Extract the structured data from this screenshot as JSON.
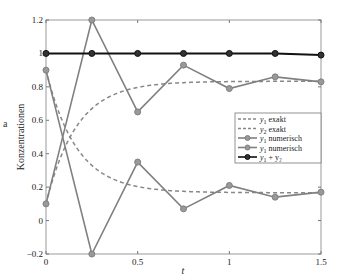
{
  "chart_data": {
    "type": "line",
    "title": "",
    "xlabel": "t",
    "ylabel": "Konzentrationen",
    "xlim": [
      0,
      1.5
    ],
    "ylim": [
      -0.2,
      1.2
    ],
    "grid": false,
    "legend_position": "right-center inside",
    "x_ticks": [
      0,
      0.5,
      1,
      1.5
    ],
    "x_tick_labels": [
      "0",
      "0.5",
      "1",
      "1.5"
    ],
    "y_ticks": [
      -0.2,
      0,
      0.2,
      0.4,
      0.6,
      0.8,
      1,
      1.2
    ],
    "y_tick_labels": [
      "−0.2",
      "0",
      "0.2",
      "0.4",
      "0.6",
      "0.8",
      "1",
      "1.2"
    ],
    "x": [
      0,
      0.25,
      0.5,
      0.75,
      1.0,
      1.25,
      1.5
    ],
    "series": [
      {
        "name": "y₁ exakt",
        "label_main": "y",
        "label_sub": "1",
        "label_rest": " exakt",
        "style": "dashed",
        "color": "#888888",
        "marker": "none",
        "function": "1/6 + (0.9 - 1/6) * exp(-6 t)"
      },
      {
        "name": "y₂ exakt",
        "label_main": "y",
        "label_sub": "2",
        "label_rest": " exakt",
        "style": "dashed",
        "color": "#888888",
        "marker": "none",
        "function": "5/6 - (5/6 - 0.1) * exp(-6 t)"
      },
      {
        "name": "y₁ numerisch",
        "label_main": "y",
        "label_sub": "1",
        "label_rest": " numerisch",
        "style": "solid",
        "color": "#808080",
        "marker": "circle",
        "values": [
          0.9,
          -0.2,
          0.35,
          0.07,
          0.21,
          0.14,
          0.17
        ]
      },
      {
        "name": "y₁ numerisch",
        "label_main": "y",
        "label_sub": "1",
        "label_rest": " numerisch",
        "style": "solid",
        "color": "#808080",
        "marker": "circle",
        "values": [
          0.1,
          1.2,
          0.65,
          0.93,
          0.79,
          0.86,
          0.83
        ]
      },
      {
        "name": "y₁ + y₂",
        "label_main": "y",
        "label_sub": "1",
        "label_rest": " + y₂",
        "style": "solid",
        "color": "#111111",
        "marker": "circle",
        "values": [
          1.0,
          1.0,
          1.0,
          1.0,
          1.0,
          1.0,
          0.99
        ]
      }
    ]
  },
  "stray_glyph": "a"
}
